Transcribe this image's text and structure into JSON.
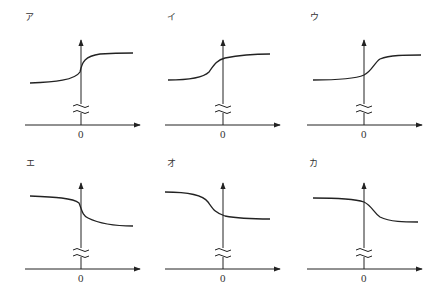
{
  "figure": {
    "panels": [
      {
        "label": "ア",
        "zero_label": "0",
        "direction": "increasing",
        "transition": "steep, centered at x=0"
      },
      {
        "label": "イ",
        "zero_label": "0",
        "direction": "increasing",
        "transition": "gradual, centered left of x=0"
      },
      {
        "label": "ウ",
        "zero_label": "0",
        "direction": "increasing",
        "transition": "gradual, centered right of x=0"
      },
      {
        "label": "エ",
        "zero_label": "0",
        "direction": "decreasing",
        "transition": "steep, centered at x=0"
      },
      {
        "label": "オ",
        "zero_label": "0",
        "direction": "decreasing",
        "transition": "gradual, centered left of x=0"
      },
      {
        "label": "カ",
        "zero_label": "0",
        "direction": "decreasing",
        "transition": "gradual, centered right of x=0"
      }
    ]
  },
  "colors": {
    "line": "#222222",
    "background": "#ffffff"
  }
}
